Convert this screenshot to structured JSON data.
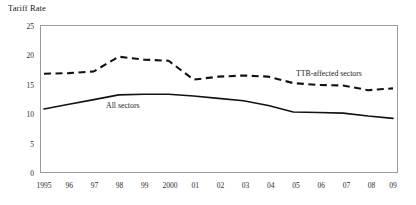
{
  "chart_data": {
    "type": "line",
    "title": "Tariff Rate",
    "xlabel": "",
    "ylabel": "",
    "ylim": [
      0,
      25
    ],
    "yticks": [
      0,
      5,
      10,
      15,
      20,
      25
    ],
    "grid": false,
    "legend_position": "inline-annotation",
    "categories": [
      "1995",
      "96",
      "97",
      "98",
      "99",
      "2000",
      "01",
      "02",
      "03",
      "04",
      "05",
      "06",
      "07",
      "08",
      "09"
    ],
    "series": [
      {
        "name": "All sectors",
        "style": "solid",
        "values": [
          10.8,
          11.6,
          12.4,
          13.2,
          13.3,
          13.3,
          13.0,
          12.6,
          12.2,
          11.4,
          10.3,
          10.2,
          10.1,
          9.6,
          9.2
        ]
      },
      {
        "name": "TTB-affected sectors",
        "style": "dashed",
        "values": [
          16.8,
          16.9,
          17.2,
          19.7,
          19.2,
          19.0,
          15.8,
          16.3,
          16.5,
          16.3,
          15.2,
          14.9,
          14.8,
          14.0,
          14.3
        ]
      }
    ],
    "annotations": [
      {
        "text": "TTB-affected sectors",
        "x": "07",
        "y": 17.0
      },
      {
        "text": "All sectors",
        "x": "98",
        "y": 11.5
      }
    ]
  },
  "colors": {
    "line": "#121212",
    "frame": "#9a9a9a",
    "text": "#1a1a1a",
    "background": "#ffffff"
  }
}
